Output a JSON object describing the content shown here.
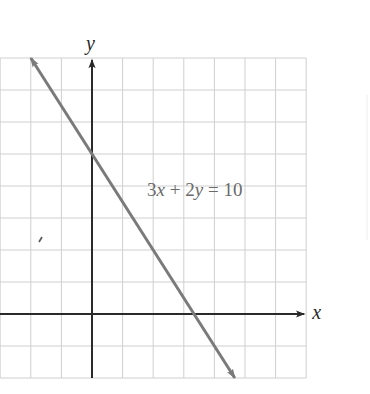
{
  "chart_data": {
    "type": "line",
    "title": "",
    "xlabel": "x",
    "ylabel": "y",
    "xlim": [
      -3,
      7
    ],
    "ylim": [
      -2,
      8
    ],
    "grid": true,
    "grid_step": 1,
    "tick_labels_shown": false,
    "series": [
      {
        "name": "3x + 2y = 10",
        "equation": "3x + 2y = 10",
        "slope": -1.5,
        "y_intercept": 5,
        "x_intercept": 3.333,
        "points": [
          {
            "x": -2,
            "y": 8
          },
          {
            "x": 0,
            "y": 5
          },
          {
            "x": 2,
            "y": 2
          },
          {
            "x": 3.333,
            "y": 0
          },
          {
            "x": 4.667,
            "y": -2
          }
        ],
        "arrows_both_ends": true
      }
    ],
    "annotations": [
      {
        "text": "3x + 2y = 10",
        "x": 1.8,
        "y": 3.7
      }
    ]
  },
  "labels": {
    "x_axis": "x",
    "y_axis": "y",
    "equation": {
      "c1": "3",
      "v1": "x",
      "op1": " + ",
      "c2": "2",
      "v2": "y",
      "op2": " = ",
      "rhs": "10"
    }
  },
  "colors": {
    "grid": "#cfcfcf",
    "axes": "#2a2a2a",
    "line": "#7a7a7a",
    "equation_text": "#6a6a6a"
  }
}
